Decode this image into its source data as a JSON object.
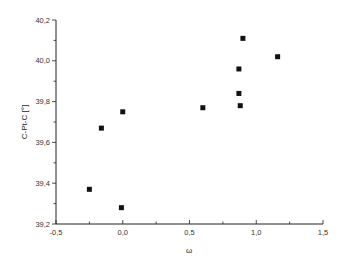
{
  "chart_data": {
    "type": "scatter",
    "title": "",
    "xlabel": "ω",
    "ylabel": "C-Pt-C [°]",
    "xlim": [
      -0.5,
      1.5
    ],
    "ylim": [
      39.2,
      40.2
    ],
    "x_ticks": [
      -0.5,
      0.0,
      0.5,
      1.0,
      1.5
    ],
    "x_tick_labels": [
      "-0,5",
      "0,0",
      "0,5",
      "1,0",
      "1,5"
    ],
    "y_ticks": [
      39.2,
      39.4,
      39.6,
      39.8,
      40.0,
      40.2
    ],
    "y_tick_labels": [
      "39,2",
      "39,4",
      "39,6",
      "39,8",
      "40,0",
      "40,2"
    ],
    "grid": false,
    "legend": null,
    "marker": "square",
    "marker_color": "#111111",
    "series": [
      {
        "name": "C-Pt-C vs ω",
        "points": [
          {
            "x": -0.25,
            "y": 39.37
          },
          {
            "x": -0.16,
            "y": 39.67
          },
          {
            "x": 0.0,
            "y": 39.75
          },
          {
            "x": -0.01,
            "y": 39.28
          },
          {
            "x": 0.6,
            "y": 39.77
          },
          {
            "x": 0.87,
            "y": 39.96
          },
          {
            "x": 0.9,
            "y": 40.11
          },
          {
            "x": 1.16,
            "y": 40.02
          },
          {
            "x": 0.87,
            "y": 39.84
          },
          {
            "x": 0.88,
            "y": 39.78
          }
        ]
      }
    ]
  }
}
